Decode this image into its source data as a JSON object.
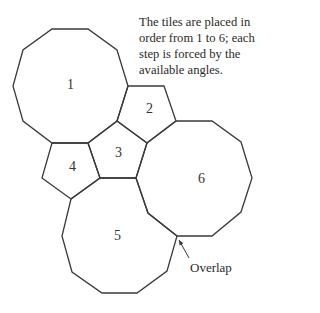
{
  "caption": {
    "lines": [
      "The tiles are placed in",
      "order from 1 to 6; each",
      "step is forced by the",
      "available angles."
    ]
  },
  "tiles": [
    {
      "label": "1",
      "shape": "decagon",
      "points": "52,29 88,29 117,50 128,86 117,121 88,143 52,143 23,121 13,86 23,50",
      "label_pos": [
        71,
        86
      ]
    },
    {
      "label": "2",
      "shape": "pentagon",
      "points": "128,86 164,86 176,121 147,143 117,121",
      "label_pos": [
        150,
        110
      ]
    },
    {
      "label": "3",
      "shape": "pentagon",
      "points": "117,121 147,143 136,178 100,178 88,143",
      "label_pos": [
        119,
        154
      ]
    },
    {
      "label": "4",
      "shape": "pentagon",
      "points": "52,143 88,143 100,178 71,199 42,178",
      "label_pos": [
        73,
        168
      ]
    },
    {
      "label": "5",
      "shape": "decagon",
      "points": "100,178 136,178 148,213 177,236 167,271 137,293 102,293 72,272 62,236 71,199",
      "label_pos": [
        118,
        237
      ]
    },
    {
      "label": "6",
      "shape": "decagon",
      "points": "176,121 212,121 241,142 252,178 241,212 212,236 177,236 148,213 136,178 147,143",
      "label_pos": [
        202,
        180
      ]
    }
  ],
  "annotation": {
    "text": "Overlap",
    "arrow_from": [
      189,
      258
    ],
    "arrow_to": [
      179,
      240
    ]
  },
  "colors": {
    "stroke": "#3a3a3a",
    "text": "#2a2a2a"
  }
}
